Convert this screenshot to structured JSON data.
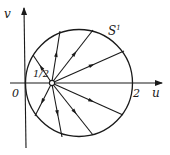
{
  "labels": {
    "v_axis": "v",
    "u_axis": "u",
    "origin": "0",
    "focus": "1/2",
    "right_intercept": "2",
    "circle": "S",
    "circle_sup": "1"
  },
  "geometry": {
    "origin_px": [
      25,
      83
    ],
    "px_per_unit": 53.5,
    "circle_center_uv": [
      1,
      0
    ],
    "circle_radius_u": 1,
    "focus_uv": [
      0.5,
      0
    ],
    "ray_endpoints_px": [
      [
        33,
        55
      ],
      [
        60,
        31
      ],
      [
        93,
        30
      ],
      [
        124,
        51
      ],
      [
        35,
        116
      ],
      [
        62,
        137
      ],
      [
        93,
        135
      ],
      [
        123,
        115
      ]
    ],
    "ray_direction": "outward"
  },
  "colors": {
    "ink": "#1a1a1a",
    "background": "#ffffff"
  }
}
